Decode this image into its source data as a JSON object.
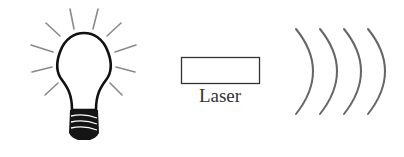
{
  "diagram": {
    "elements": [
      {
        "id": "light-bulb",
        "type": "icon",
        "description": "Incandescent light bulb with radiating rays"
      },
      {
        "id": "laser",
        "type": "rectangle",
        "label": "Laser"
      },
      {
        "id": "waves",
        "type": "arcs",
        "count": 4,
        "description": "Curved wavefronts"
      }
    ],
    "laser_label": "Laser",
    "colors": {
      "stroke": "#1a1a1a",
      "rays": "#888888",
      "waves": "#666666",
      "background": "#ffffff"
    }
  }
}
